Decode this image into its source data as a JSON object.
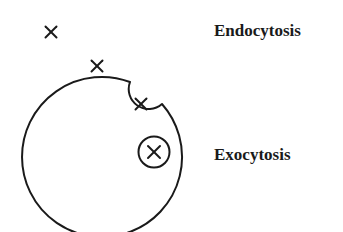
{
  "diagram": {
    "title": "",
    "labels": {
      "endocytosis": "Endocytosis",
      "exocytosis": "Exocytosis"
    },
    "colors": {
      "stroke": "#1a1a1a",
      "background": "#ffffff",
      "text": "#1a1a1a"
    },
    "elements": {
      "cell": {
        "shape": "circle-with-notch",
        "cx": 102.5,
        "cy": 154,
        "r": 80
      },
      "endocytic_pocket": {
        "shape": "invagination",
        "cx": 143,
        "cy": 104,
        "r": 20
      },
      "vesicle": {
        "shape": "circle",
        "cx": 154,
        "cy": 152,
        "r": 16
      },
      "particles": [
        {
          "id": "outside-far",
          "x": 51,
          "y": 32,
          "glyph": "×"
        },
        {
          "id": "outside-near",
          "x": 97,
          "y": 66,
          "glyph": "×"
        },
        {
          "id": "in-pocket",
          "x": 141,
          "y": 104,
          "glyph": "×"
        },
        {
          "id": "in-vesicle",
          "x": 154,
          "y": 152,
          "glyph": "×"
        }
      ]
    }
  }
}
